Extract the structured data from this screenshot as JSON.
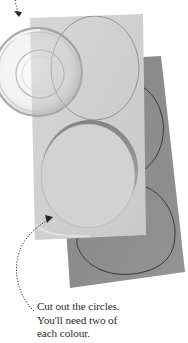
{
  "illustration": {
    "description": "Step illustration: a glass bowl traced onto light grey paper, with circles cut out of light grey and dark grey paper",
    "colors": {
      "background": "#ffffff",
      "light_paper": "#cfcfcf",
      "dark_paper": "#8f8f8f",
      "circle_outline": "#3a3a3a",
      "arrow": "#333333",
      "caption_text": "#2b2b2b"
    },
    "objects": [
      {
        "name": "glass-bowl",
        "label": "Glass bowl used as a circle template"
      },
      {
        "name": "light-paper",
        "label": "Light grey paper with traced circles"
      },
      {
        "name": "dark-paper",
        "label": "Dark grey paper with traced circles"
      },
      {
        "name": "cut-circle",
        "label": "Circle being cut out"
      }
    ]
  },
  "caption": {
    "lines": [
      "Cut out the circles.",
      "You'll need two of",
      "each colour."
    ]
  }
}
